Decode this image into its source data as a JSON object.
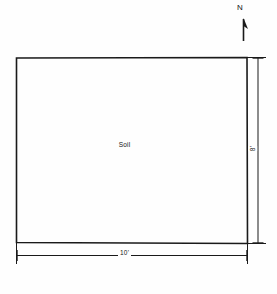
{
  "figure": {
    "background_color": "#fefefe",
    "line_color": "#1a1a1a"
  },
  "compass": {
    "label": "N",
    "icon": "north-arrow-icon",
    "direction": "up"
  },
  "plot": {
    "fill_label": "Soil"
  },
  "dimensions": {
    "width": {
      "label": "10'",
      "value": 10,
      "unit": "ft",
      "orientation": "horizontal",
      "position": "bottom"
    },
    "height": {
      "label": "8'",
      "value": 8,
      "unit": "ft",
      "orientation": "vertical",
      "position": "right"
    }
  }
}
